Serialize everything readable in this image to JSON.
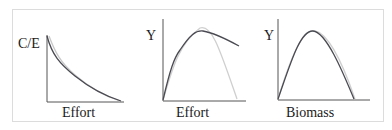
{
  "panels": [
    {
      "id": "cpue",
      "ylabel": "C/E",
      "xlabel": "Effort",
      "description": "Catch per unit effort declines with effort"
    },
    {
      "id": "yield-effort",
      "ylabel": "Y",
      "xlabel": "Effort",
      "description": "Yield vs effort: rises to peak then declines; dark curve flattens, light curve falls to zero"
    },
    {
      "id": "yield-biomass",
      "ylabel": "Y",
      "xlabel": "Biomass",
      "description": "Yield vs biomass: dome-shaped curve"
    }
  ],
  "colors": {
    "axis": "#555555",
    "curve_dark": "#4a4a52",
    "curve_light": "#c8c8c8",
    "frame": "#dcdcdc"
  }
}
